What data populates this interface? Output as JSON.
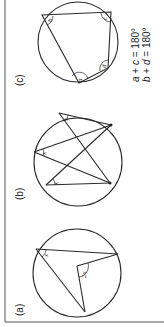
{
  "figure": {
    "orientation": "rotated-90-ccw",
    "panels": [
      {
        "id": "a",
        "label": "(a)",
        "description": "Angle at centre is twice the angle at the circumference",
        "angles": {
          "circumference": "x",
          "centre": "2x"
        }
      },
      {
        "id": "b",
        "label": "(b)",
        "description": "Angles in the same segment are equal",
        "angles": [
          "x",
          "x",
          "x"
        ]
      },
      {
        "id": "c",
        "label": "(c)",
        "description": "Opposite angles of a cyclic quadrilateral sum to 180°",
        "angles": [
          "a",
          "b",
          "c",
          "d"
        ],
        "equations": [
          {
            "lhs_1": "a",
            "op": " + ",
            "lhs_2": "c",
            "rhs": " = 180°"
          },
          {
            "lhs_1": "b",
            "op": " + ",
            "lhs_2": "d",
            "rhs": " = 180°"
          }
        ]
      }
    ]
  },
  "colors": {
    "line": "#2a2a2a",
    "background": "#ffffff",
    "frame": "#555555"
  }
}
